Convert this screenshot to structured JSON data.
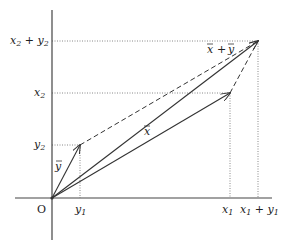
{
  "diagram": {
    "origin_label": "O",
    "axis_labels": {
      "x_ticks": [
        {
          "text": "y",
          "sub": "1",
          "x": 80
        },
        {
          "text": "x",
          "sub": "1",
          "x": 230
        },
        {
          "text": "x",
          "sub": "1",
          "plus": " + ",
          "text2": "y",
          "sub2": "1",
          "x": 258
        }
      ],
      "y_ticks": [
        {
          "text": "y",
          "sub": "2",
          "y": 145
        },
        {
          "text": "x",
          "sub": "2",
          "y": 93
        },
        {
          "text": "x",
          "sub": "2",
          "plus": " + ",
          "text2": "y",
          "sub2": "2",
          "y": 41
        }
      ]
    },
    "vectors": [
      {
        "name": "x",
        "label": "x⃗",
        "from": [
          52,
          198
        ],
        "to": [
          230,
          93
        ],
        "style": "solid"
      },
      {
        "name": "y",
        "label": "y⃗",
        "from": [
          52,
          198
        ],
        "to": [
          80,
          145
        ],
        "style": "solid"
      },
      {
        "name": "x_plus_y",
        "label": "x⃗ + y⃗",
        "from": [
          52,
          198
        ],
        "to": [
          258,
          41
        ],
        "style": "solid"
      }
    ],
    "dashed_edges": [
      {
        "from": [
          80,
          145
        ],
        "to": [
          258,
          41
        ]
      },
      {
        "from": [
          230,
          93
        ],
        "to": [
          258,
          41
        ]
      }
    ],
    "vector_labels": {
      "x": "x",
      "y": "y",
      "sum_x": "x",
      "sum_plus": "+",
      "sum_y": "y"
    },
    "colors": {
      "axis": "#444444",
      "vector": "#333333",
      "dashed": "#333333",
      "dotted": "#888888"
    }
  }
}
